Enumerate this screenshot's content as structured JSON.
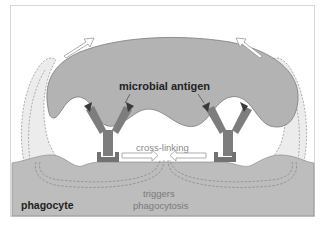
{
  "diagram": {
    "labels": {
      "microbial_antigen": "microbial antigen",
      "cross_linking": "cross-linking",
      "triggers_line1": "triggers",
      "triggers_line2": "phagocytosis",
      "phagocyte": "phagocyte"
    },
    "colors": {
      "microbe_fill": "#b3b3b3",
      "microbe_stroke": "#7a7a7a",
      "phagocyte_fill": "#bdbdbd",
      "antibody_fill": "#7d7d7d",
      "antigen_fill": "#3a3a3a",
      "receptor_fill": "#727272",
      "pseudopod_fill": "#ececec",
      "dashed_stroke": "#8c8c8c",
      "arrow_stroke": "#9a9a9a"
    },
    "elements": {
      "antibodies": 2,
      "antigens": 4,
      "fc_receptors": 2,
      "outline_arrows": 4,
      "dashed_signal_paths": 2
    }
  }
}
